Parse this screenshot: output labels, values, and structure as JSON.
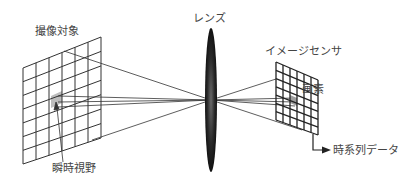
{
  "diagram": {
    "labels": {
      "target": "撮像対象",
      "lens": "レンズ",
      "sensor": "イメージセンサ",
      "pixel": "画素",
      "ifov": "瞬時視野",
      "output": "時系列データ"
    },
    "colors": {
      "line": "#333333",
      "shade": "#bdbdbd",
      "lens": "#222222"
    }
  }
}
